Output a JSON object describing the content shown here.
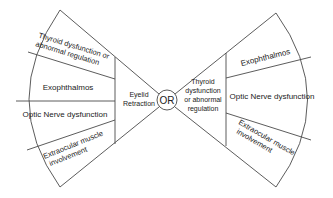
{
  "diagram": {
    "center": {
      "label": "OR"
    },
    "left": {
      "hub_label": [
        "Eyelid",
        "Retraction"
      ],
      "segments": [
        {
          "lines": [
            "Thyroid dysfunction or",
            "abnormal regulation"
          ]
        },
        {
          "lines": [
            "Exophthalmos"
          ]
        },
        {
          "lines": [
            "Optic Nerve dysfunction"
          ]
        },
        {
          "lines": [
            "Extraocular muscle",
            "involvement"
          ]
        }
      ]
    },
    "right": {
      "hub_label": [
        "Thyroid",
        "dysfunction",
        "or abnormal",
        "regulation"
      ],
      "segments": [
        {
          "lines": [
            "Exophthalmos"
          ]
        },
        {
          "lines": [
            "Optic Nerve dysfunction"
          ]
        },
        {
          "lines": [
            "Extraocular muscle",
            "involvement"
          ]
        }
      ]
    },
    "colors": {
      "line": "#4a4a4a",
      "text": "#222222",
      "background": "#ffffff"
    }
  }
}
